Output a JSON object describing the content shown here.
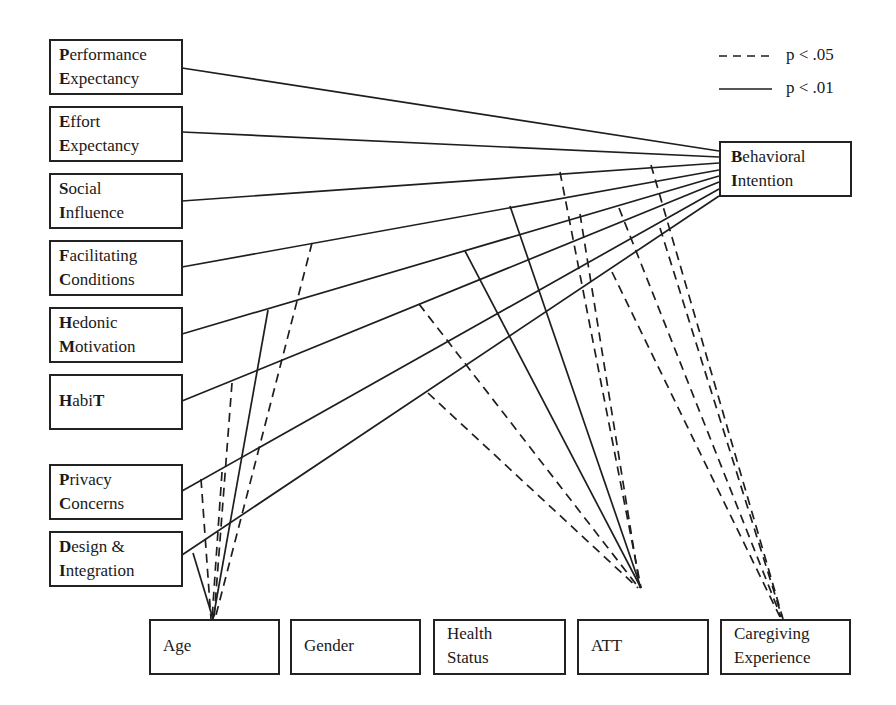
{
  "legend": {
    "dashed_label": "p < .05",
    "solid_label": "p < .01"
  },
  "predictors": [
    {
      "id": "PE",
      "line1_initial": "P",
      "line1_rest": "erformance",
      "line2_initial": "E",
      "line2_rest": "xpectancy"
    },
    {
      "id": "EE",
      "line1_initial": "E",
      "line1_rest": "ffort",
      "line2_initial": "E",
      "line2_rest": "xpectancy"
    },
    {
      "id": "SI",
      "line1_initial": "S",
      "line1_rest": "ocial",
      "line2_initial": "I",
      "line2_rest": "nfluence"
    },
    {
      "id": "FC",
      "line1_initial": "F",
      "line1_rest": "acilitating",
      "line2_initial": "C",
      "line2_rest": "onditions"
    },
    {
      "id": "HM",
      "line1_initial": "H",
      "line1_rest": "edonic",
      "line2_initial": "M",
      "line2_rest": "otivation"
    },
    {
      "id": "HT",
      "line1_initial": "H",
      "line1_rest": "abi",
      "line1_final": "T"
    },
    {
      "id": "PC",
      "line1_initial": "P",
      "line1_rest": "rivacy",
      "line2_initial": "C",
      "line2_rest": "oncerns"
    },
    {
      "id": "DI",
      "line1_initial": "D",
      "line1_rest": "esign &",
      "line2_initial": "I",
      "line2_rest": "ntegration"
    }
  ],
  "outcome": {
    "id": "BI",
    "line1_initial": "B",
    "line1_rest": "ehavioral",
    "line2_initial": "I",
    "line2_rest": "ntention"
  },
  "moderators": [
    {
      "id": "Age",
      "line1": "Age"
    },
    {
      "id": "Gender",
      "line1": "Gender"
    },
    {
      "id": "Health",
      "line1": "Health",
      "line2": "Status"
    },
    {
      "id": "ATT",
      "line1": "ATT"
    },
    {
      "id": "Caregiving",
      "line1": "Caregiving",
      "line2": "Experience"
    }
  ],
  "paths": {
    "direct_significance": "p < .01",
    "direct": [
      "PE->BI",
      "EE->BI",
      "SI->BI",
      "FC->BI",
      "HM->BI",
      "HT->BI",
      "PC->BI",
      "DI->BI"
    ],
    "moderation": {
      "Age": {
        "solid": [
          "FC->BI",
          "DI->BI"
        ],
        "dashed": [
          "SI->BI",
          "HT->BI",
          "PC->BI",
          "PC->BI (2)"
        ]
      },
      "ATT": {
        "solid": [
          "SI->BI",
          "FC->BI"
        ],
        "dashed": [
          "HM->BI",
          "PC->BI",
          "SI->BI",
          "HT->BI"
        ]
      },
      "Caregiving": {
        "solid": [],
        "dashed": [
          "SI->BI",
          "FC->BI",
          "HT->BI",
          "DI->BI"
        ]
      }
    }
  }
}
